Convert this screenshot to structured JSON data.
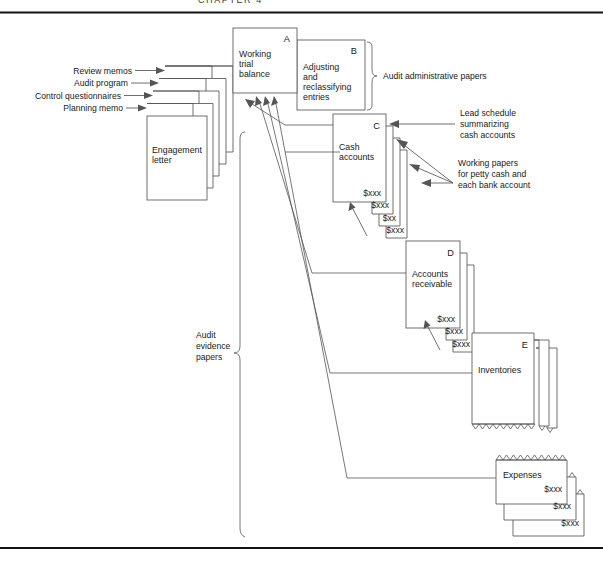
{
  "page": {
    "header_fragment": "CHAPTER 4",
    "width": 603,
    "height": 565,
    "ink_color": "#555555",
    "text_color": "#1a1a1a",
    "rule_color": "#111111"
  },
  "inputs": [
    {
      "label": "Review memos"
    },
    {
      "label": "Audit program"
    },
    {
      "label": "Control questionnaires"
    },
    {
      "label": "Planning memo"
    }
  ],
  "engagement": {
    "line1": "Engagement",
    "line2": "letter"
  },
  "boxes": {
    "a": {
      "letter": "A",
      "line1": "Working",
      "line2": "trial",
      "line3": "balance"
    },
    "b": {
      "letter": "B",
      "line1": "Adjusting",
      "line2": "and",
      "line3": "reclassifying",
      "line4": "entries"
    },
    "c": {
      "letter": "C",
      "line1": "Cash",
      "line2": "accounts"
    },
    "d": {
      "letter": "D",
      "line1": "Accounts",
      "line2": "receivable"
    },
    "e": {
      "letter": "E",
      "line1": "Inventories"
    },
    "expenses": {
      "line1": "Expenses"
    }
  },
  "amounts": {
    "cash": [
      "$xxx",
      "$xxx",
      "$xx",
      "$xxx"
    ],
    "receivable": [
      "$xxx",
      "$xxx",
      "$xxx"
    ],
    "expenses": [
      "$xxx",
      "$xxx",
      "$xxx"
    ]
  },
  "callouts": {
    "admin": "Audit administrative papers",
    "lead_schedule": {
      "line1": "Lead schedule",
      "line2": "summarizing",
      "line3": "cash accounts"
    },
    "working_papers": {
      "line1": "Working papers",
      "line2": "for petty cash and",
      "line3": "each bank account"
    },
    "evidence": {
      "line1": "Audit",
      "line2": "evidence",
      "line3": "papers"
    }
  }
}
